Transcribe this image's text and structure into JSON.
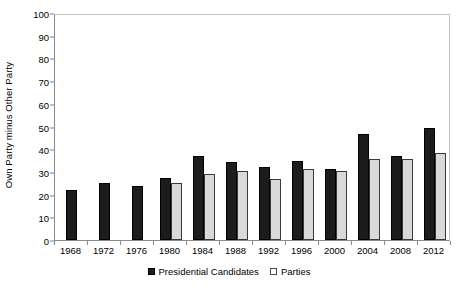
{
  "chart_data": {
    "type": "bar",
    "title": "",
    "xlabel": "",
    "ylabel": "Own Party minus Other Party",
    "ylim": [
      0,
      100
    ],
    "ytick_step": 10,
    "yticks": [
      100,
      90,
      80,
      70,
      60,
      50,
      40,
      30,
      20,
      10,
      0
    ],
    "grid": false,
    "legend_position": "bottom-center",
    "categories": [
      "1968",
      "1972",
      "1976",
      "1980",
      "1984",
      "1988",
      "1992",
      "1996",
      "2000",
      "2004",
      "2008",
      "2012"
    ],
    "series": [
      {
        "name": "Presidential Candidates",
        "color": "#1c1c1c",
        "values": [
          22,
          25,
          24,
          27.5,
          37,
          34.5,
          32,
          35,
          31.5,
          46.5,
          37,
          49.5
        ]
      },
      {
        "name": "Parties",
        "color": "#d9d9d9",
        "values": [
          null,
          null,
          null,
          25,
          29,
          30.5,
          27,
          31.5,
          30.5,
          35.5,
          35.5,
          38.5
        ]
      }
    ]
  },
  "legend": {
    "items": [
      {
        "label": "Presidential Candidates",
        "marker": "filled-square-icon"
      },
      {
        "label": "Parties",
        "marker": "hollow-square-icon"
      }
    ]
  }
}
